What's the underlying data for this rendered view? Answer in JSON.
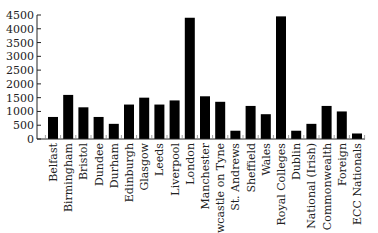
{
  "chart_data": {
    "type": "bar",
    "title": "",
    "xlabel": "",
    "ylabel": "",
    "ylim": [
      0,
      4500
    ],
    "yticks": [
      0,
      500,
      1000,
      1500,
      2000,
      2500,
      3000,
      3500,
      4000,
      4500
    ],
    "grid": false,
    "legend": null,
    "categories": [
      "Belfast",
      "Birmingham",
      "Bristol",
      "Dundee",
      "Durham",
      "Edinburgh",
      "Glasgow",
      "Leeds",
      "Liverpool",
      "London",
      "Manchester",
      "Newcastle on Tyne",
      "St. Andrews",
      "Sheffield",
      "Wales",
      "Royal Colleges",
      "Dublin",
      "National (Irish)",
      "Commonwealth",
      "Foreign",
      "ECC Nationals"
    ],
    "values": [
      800,
      1600,
      1150,
      800,
      550,
      1250,
      1500,
      1250,
      1400,
      4400,
      1550,
      1350,
      300,
      1200,
      900,
      4450,
      300,
      550,
      1200,
      1000,
      200
    ],
    "bar_color": "#000000"
  }
}
